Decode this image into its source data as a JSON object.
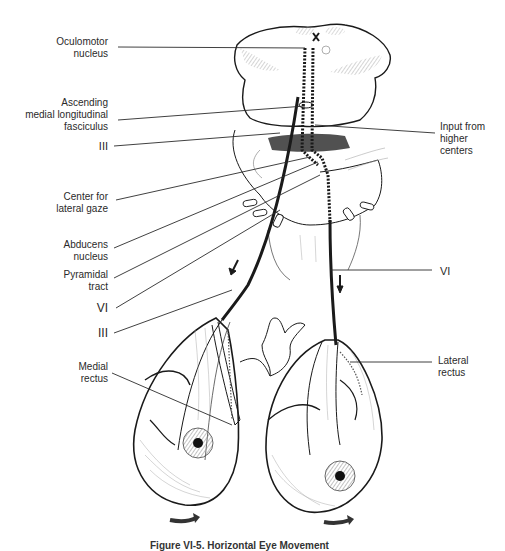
{
  "figure": {
    "caption": "Figure VI-5. Horizontal Eye Movement",
    "labels_left": [
      {
        "id": "oculomotor-nucleus",
        "lines": [
          "Oculomotor",
          "nucleus"
        ]
      },
      {
        "id": "ascending-mlf",
        "lines": [
          "Ascending",
          "medial longitudinal",
          "fasciculus"
        ]
      },
      {
        "id": "cn-iii-upper",
        "lines": [
          "III"
        ]
      },
      {
        "id": "center-lateral-gaze",
        "lines": [
          "Center for",
          "lateral gaze"
        ]
      },
      {
        "id": "abducens-nucleus",
        "lines": [
          "Abducens",
          "nucleus"
        ]
      },
      {
        "id": "pyramidal-tract",
        "lines": [
          "Pyramidal",
          "tract"
        ]
      },
      {
        "id": "cn-vi-left",
        "lines": [
          "VI"
        ]
      },
      {
        "id": "cn-iii-lower",
        "lines": [
          "III"
        ]
      },
      {
        "id": "medial-rectus",
        "lines": [
          "Medial",
          "rectus"
        ]
      }
    ],
    "labels_right": [
      {
        "id": "input-higher-centers",
        "lines": [
          "Input from",
          "higher",
          "centers"
        ]
      },
      {
        "id": "cn-vi-right",
        "lines": [
          "VI"
        ]
      },
      {
        "id": "lateral-rectus",
        "lines": [
          "Lateral",
          "rectus"
        ]
      }
    ],
    "structures": [
      "brainstem-midbrain",
      "pons",
      "medulla",
      "left-eye",
      "right-eye",
      "optic-chiasm",
      "nerve-iii-tract",
      "nerve-vi-tract",
      "mlf-dotted-pathway"
    ],
    "arrows": {
      "left_eye_rotation": "rightward",
      "right_eye_rotation": "rightward",
      "nerve_direction": "downward"
    },
    "colors": {
      "ink": "#1a1a1a",
      "line": "#2b2b2b",
      "background": "#ffffff",
      "shading": "#9a9a9a"
    }
  }
}
